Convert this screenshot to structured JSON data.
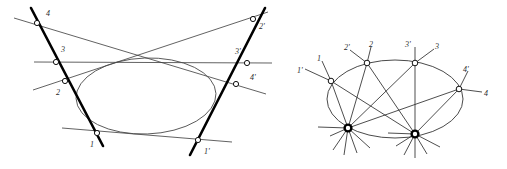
{
  "figure": {
    "background_color": "#ffffff",
    "ink_color": "#1a1a1a",
    "thick_line_color": "#000000",
    "thin_line_color": "#3a3a3a",
    "conic_color": "#4a4a4a",
    "node_fill": "#ffffff",
    "label_color": "#2b2b2b",
    "panels": [
      {
        "name": "left-panel",
        "description": "Conic with two tangent-like thick transversals carrying point ranges 1-2-3-4 and 1'-2'-3'-4', plus cross-joining thin lines",
        "conic": {
          "cx": 146,
          "cy": 96,
          "rx": 70,
          "ry": 38,
          "rotation": -2
        },
        "thick_lines": [
          {
            "name": "left-range-line",
            "x1": 31,
            "y1": 8,
            "x2": 103,
            "y2": 146
          },
          {
            "name": "right-range-line",
            "x1": 265,
            "y1": 8,
            "x2": 190,
            "y2": 155
          }
        ],
        "points": [
          {
            "id": "4",
            "x": 37,
            "y": 23,
            "label": "4",
            "lx": 46,
            "ly": 16
          },
          {
            "id": "3",
            "x": 56,
            "y": 62,
            "label": "3",
            "lx": 61,
            "ly": 52
          },
          {
            "id": "2",
            "x": 65,
            "y": 81,
            "label": "2",
            "lx": 56,
            "ly": 95
          },
          {
            "id": "1",
            "x": 97,
            "y": 133,
            "label": "1",
            "lx": 90,
            "ly": 147
          },
          {
            "id": "2p",
            "x": 253,
            "y": 19,
            "label": "2'",
            "lx": 259,
            "ly": 29
          },
          {
            "id": "3p",
            "x": 247,
            "y": 63,
            "label": "3'",
            "lx": 235,
            "ly": 54
          },
          {
            "id": "4p",
            "x": 236,
            "y": 84,
            "label": "4'",
            "lx": 250,
            "ly": 80
          },
          {
            "id": "1p",
            "x": 198,
            "y": 140,
            "label": "1'",
            "lx": 204,
            "ly": 154
          }
        ],
        "thin_lines": [
          {
            "name": "line-4-to-4p",
            "from": "4",
            "to": "4p"
          },
          {
            "name": "line-2-to-2p",
            "from": "2",
            "to": "2p"
          },
          {
            "name": "line-3-to-3p",
            "from": "3",
            "to": "3p"
          },
          {
            "name": "line-1-to-1p",
            "from": "1",
            "to": "1p"
          }
        ]
      },
      {
        "name": "right-panel",
        "description": "Conic with four points 1,2,3,4 on it, pencils of lines from two heavy vertices, and short external ray stubs labelled 1',2',3',4'",
        "conic": {
          "cx": 395,
          "cy": 99,
          "rx": 68,
          "ry": 39,
          "rotation": 0
        },
        "points": [
          {
            "id": "1",
            "x": 331,
            "y": 81,
            "label": "1",
            "lx": 319,
            "ly": 58,
            "tick_label": "1'",
            "tx": 299,
            "ty": 70
          },
          {
            "id": "2",
            "x": 367,
            "y": 63,
            "label": "2",
            "lx": 370,
            "ly": 44,
            "tick_label": "2'",
            "tx": 346,
            "ty": 47
          },
          {
            "id": "3",
            "x": 415,
            "y": 63,
            "label": "3",
            "lx": 437,
            "ly": 47,
            "tick_label": "3'",
            "tx": 407,
            "ty": 44
          },
          {
            "id": "4",
            "x": 459,
            "y": 89,
            "label": "4",
            "lx": 485,
            "ly": 95,
            "tick_label": "4'",
            "tx": 464,
            "ty": 70
          }
        ],
        "hubs": [
          {
            "id": "hubA",
            "x": 348,
            "y": 128,
            "name": "pencil-vertex-left"
          },
          {
            "id": "hubB",
            "x": 415,
            "y": 134,
            "name": "pencil-vertex-right"
          }
        ]
      }
    ]
  }
}
